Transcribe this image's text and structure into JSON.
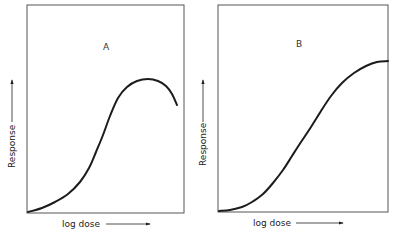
{
  "chart_data": [
    {
      "type": "line",
      "panel": "A",
      "title": "A",
      "xlabel": "log dose",
      "ylabel": "Response",
      "grid": false,
      "x": [
        0,
        0.12,
        0.26,
        0.36,
        0.43,
        0.5,
        0.56,
        0.63,
        0.71,
        0.79,
        0.86,
        0.93,
        0.97
      ],
      "values": [
        0,
        0.04,
        0.1,
        0.18,
        0.28,
        0.4,
        0.52,
        0.6,
        0.64,
        0.645,
        0.63,
        0.58,
        0.51
      ],
      "description": "Bell-shaped dose-response: rises, peaks, then declines at high doses"
    },
    {
      "type": "line",
      "panel": "B",
      "title": "B",
      "xlabel": "log dose",
      "ylabel": "Response",
      "grid": false,
      "x": [
        0,
        0.09,
        0.18,
        0.27,
        0.35,
        0.42,
        0.49,
        0.56,
        0.64,
        0.72,
        0.82,
        0.92,
        1.0
      ],
      "values": [
        0,
        0.01,
        0.04,
        0.09,
        0.17,
        0.25,
        0.35,
        0.44,
        0.54,
        0.63,
        0.69,
        0.73,
        0.735
      ],
      "description": "Sigmoid dose-response reaching a plateau"
    }
  ],
  "panels": [
    {
      "letter": "A",
      "xlabel": "log dose",
      "ylabel": "Response",
      "frame": {
        "x": 27,
        "y": 5,
        "w": 157,
        "h": 208
      },
      "letter_pos": {
        "x": 106,
        "y": 50
      },
      "curve_points": [
        [
          28,
          212
        ],
        [
          42,
          208
        ],
        [
          55,
          202
        ],
        [
          68,
          194
        ],
        [
          80,
          182
        ],
        [
          89,
          168
        ],
        [
          96,
          152
        ],
        [
          103,
          135
        ],
        [
          110,
          116
        ],
        [
          118,
          98
        ],
        [
          127,
          87
        ],
        [
          137,
          81
        ],
        [
          148,
          79
        ],
        [
          158,
          81
        ],
        [
          166,
          86
        ],
        [
          172,
          94
        ],
        [
          177,
          105
        ]
      ]
    },
    {
      "letter": "B",
      "xlabel": "log dose",
      "ylabel": "Response",
      "frame": {
        "x": 218,
        "y": 5,
        "w": 170,
        "h": 207
      },
      "letter_pos": {
        "x": 299,
        "y": 47
      },
      "curve_points": [
        [
          219,
          211
        ],
        [
          230,
          210
        ],
        [
          242,
          207
        ],
        [
          252,
          202
        ],
        [
          263,
          194
        ],
        [
          273,
          183
        ],
        [
          283,
          170
        ],
        [
          292,
          156
        ],
        [
          301,
          142
        ],
        [
          311,
          127
        ],
        [
          321,
          111
        ],
        [
          331,
          96
        ],
        [
          342,
          83
        ],
        [
          354,
          73
        ],
        [
          366,
          66
        ],
        [
          377,
          62
        ],
        [
          388,
          61
        ]
      ]
    }
  ],
  "colors": {
    "line": "#1c1c1c",
    "frame": "#555555",
    "text": "#222222"
  }
}
